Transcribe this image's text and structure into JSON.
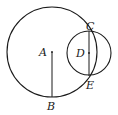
{
  "diagram": {
    "type": "geometry",
    "points": {
      "A": {
        "label": "A",
        "x": 52,
        "y": 52
      },
      "B": {
        "label": "B",
        "x": 52,
        "y": 97
      },
      "C": {
        "label": "C",
        "x": 89,
        "y": 31
      },
      "D": {
        "label": "D",
        "x": 89,
        "y": 53
      },
      "E": {
        "label": "E",
        "x": 89,
        "y": 76
      }
    },
    "circles": [
      {
        "name": "circle-A",
        "center": "A",
        "r": 45
      },
      {
        "name": "circle-D",
        "center": "D",
        "r": 22
      }
    ],
    "segments": [
      {
        "from": "A",
        "to": "B"
      },
      {
        "from": "C",
        "to": "E"
      }
    ],
    "stroke_color": "#1a1a1a"
  }
}
